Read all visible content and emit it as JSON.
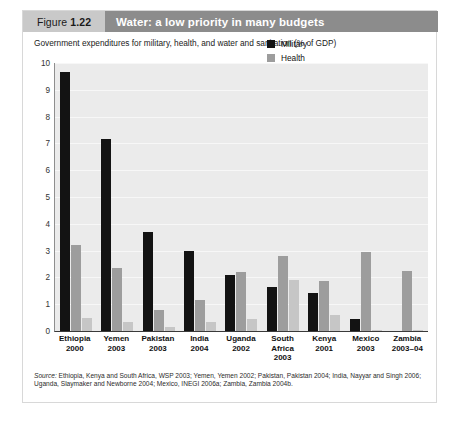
{
  "figure": {
    "tag_prefix": "Figure",
    "tag_number": "1.22",
    "title": "Water: a low priority in many budgets",
    "subtitle": "Government expenditures for military, health, and water and sanitation (% of GDP)",
    "source_label": "Source:",
    "source_text": " Ethiopia, Kenya and South Africa, WSP 2003; Yemen, Yemen 2002; Pakistan, Pakistan 2004; India, Nayyar and Singh 2006; Uganda, Slaymaker and Newborne 2004; Mexico, INEGI 2006a; Zambia, Zambia 2004b."
  },
  "colors": {
    "military": "#131313",
    "health": "#9d9d9d",
    "water": "#c6c6c6",
    "header_bar": "#8c8c8c",
    "tag_bar": "#c9c9c9",
    "plot_background": "#ebebeb"
  },
  "chart_data": {
    "type": "bar",
    "title": "Water: a low priority in many budgets",
    "subtitle": "Government expenditures for military, health, and water and sanitation (% of GDP)",
    "xlabel": "",
    "ylabel": "",
    "ylim": [
      0,
      10
    ],
    "yticks": [
      0,
      1,
      2,
      3,
      4,
      5,
      6,
      7,
      8,
      9,
      10
    ],
    "grid": true,
    "legend_position": "top-right",
    "categories": [
      "Ethiopia 2000",
      "Yemen 2003",
      "Pakistan 2003",
      "India 2004",
      "Uganda 2002",
      "South Africa 2003",
      "Kenya 2001",
      "Mexico 2003",
      "Zambia 2003–04"
    ],
    "category_lines": [
      [
        "Ethiopia",
        "2000"
      ],
      [
        "Yemen",
        "2003"
      ],
      [
        "Pakistan",
        "2003"
      ],
      [
        "India",
        "2004"
      ],
      [
        "Uganda",
        "2002"
      ],
      [
        "South",
        "Africa",
        "2003"
      ],
      [
        "Kenya",
        "2001"
      ],
      [
        "Mexico",
        "2003"
      ],
      [
        "Zambia",
        "2003–04"
      ]
    ],
    "series": [
      {
        "name": "Military",
        "color": "#131313",
        "values": [
          9.65,
          7.15,
          3.7,
          3.0,
          2.1,
          1.65,
          1.4,
          0.45,
          0.0
        ]
      },
      {
        "name": "Health",
        "color": "#9d9d9d",
        "values": [
          3.2,
          2.35,
          0.8,
          1.15,
          2.2,
          2.8,
          1.85,
          2.95,
          2.25
        ]
      },
      {
        "name": "Water and sanitation",
        "color": "#c6c6c6",
        "values": [
          0.5,
          0.35,
          0.15,
          0.35,
          0.45,
          1.9,
          0.6,
          0.05,
          0.05
        ]
      }
    ]
  }
}
